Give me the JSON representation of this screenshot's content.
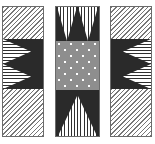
{
  "figure": {
    "canvas_width": 155,
    "canvas_height": 144,
    "background_color": "#ffffff",
    "border_color": "#6b6b6b",
    "dark_color": "#2a2a2a",
    "mid_gray_color": "#8e8e8e",
    "hatch_line_color": "#777777",
    "dot_color": "#ffffff"
  },
  "panels": [
    {
      "id": "left-panel",
      "label": "Left panel",
      "x": 2,
      "y": 6,
      "width": 42,
      "height": 131,
      "field_texture": "diagonal-hatch",
      "band": {
        "orientation": "horizontal",
        "y": 38,
        "height": 50,
        "fill": "#2a2a2a",
        "triangle_count": 2,
        "triangle_direction": "right",
        "triangle_texture": "horizontal-hatch"
      }
    },
    {
      "id": "center-panel",
      "label": "Center panel",
      "x": 55,
      "y": 6,
      "width": 45,
      "height": 131,
      "field_texture": "solid-dark",
      "center_square": {
        "y": 40,
        "height": 49,
        "fill": "#8e8e8e",
        "texture": "dot-grid",
        "dot_columns": 4,
        "dot_rows": 5,
        "dot_color": "#ffffff"
      },
      "top_triangles": {
        "count": 2,
        "direction": "down",
        "texture": "vertical-hatch"
      },
      "bottom_triangles": {
        "count": 1,
        "direction": "up",
        "texture": "vertical-hatch"
      }
    },
    {
      "id": "right-panel",
      "label": "Right panel",
      "x": 110,
      "y": 6,
      "width": 42,
      "height": 131,
      "field_texture": "diagonal-hatch",
      "band": {
        "orientation": "horizontal",
        "y": 38,
        "height": 50,
        "fill": "#2a2a2a",
        "triangle_count": 2,
        "triangle_direction": "left",
        "triangle_texture": "horizontal-hatch"
      }
    }
  ]
}
